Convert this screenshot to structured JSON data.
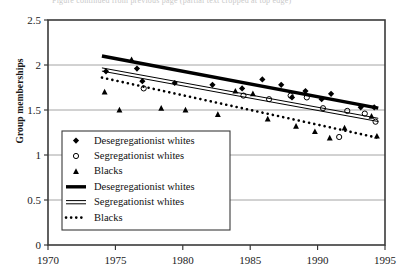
{
  "page": {
    "clipped_header_text": "Figure continued from previous page (partial text cropped at top edge)"
  },
  "chart_data": {
    "type": "scatter",
    "title": "",
    "subtitle": "",
    "xlabel": "",
    "ylabel": "Group memberships",
    "xlim": [
      1970,
      1995
    ],
    "ylim": [
      0,
      2.5
    ],
    "xticks": [
      1970,
      1975,
      1980,
      1985,
      1990,
      1995
    ],
    "yticks": [
      0,
      0.5,
      1,
      1.5,
      2,
      2.5
    ],
    "xtick_labels": [
      "1970",
      "1975",
      "1980",
      "1985",
      "1990",
      "1995"
    ],
    "ytick_labels": [
      "0",
      "0.5",
      "1",
      "1.5",
      "2",
      "2.5"
    ],
    "grid": true,
    "grid_axis": "y",
    "legend_position": "lower-left-inside",
    "series": [
      {
        "name": "Desegregationist whites",
        "kind": "scatter",
        "marker": "filled-diamond",
        "color": "#000000",
        "points": [
          {
            "x": 1974.3,
            "y": 1.93
          },
          {
            "x": 1976.6,
            "y": 1.96
          },
          {
            "x": 1977.0,
            "y": 1.82
          },
          {
            "x": 1979.4,
            "y": 1.8
          },
          {
            "x": 1982.2,
            "y": 1.78
          },
          {
            "x": 1984.4,
            "y": 1.74
          },
          {
            "x": 1985.9,
            "y": 1.84
          },
          {
            "x": 1987.3,
            "y": 1.78
          },
          {
            "x": 1988.1,
            "y": 1.64
          },
          {
            "x": 1989.1,
            "y": 1.71
          },
          {
            "x": 1990.3,
            "y": 1.62
          },
          {
            "x": 1991.0,
            "y": 1.68
          },
          {
            "x": 1993.2,
            "y": 1.53
          },
          {
            "x": 1994.2,
            "y": 1.53
          }
        ]
      },
      {
        "name": "Segregationist whites",
        "kind": "scatter",
        "marker": "open-circle",
        "color": "#000000",
        "points": [
          {
            "x": 1977.1,
            "y": 1.74
          },
          {
            "x": 1984.5,
            "y": 1.66
          },
          {
            "x": 1986.4,
            "y": 1.62
          },
          {
            "x": 1988.0,
            "y": 1.66
          },
          {
            "x": 1989.2,
            "y": 1.64
          },
          {
            "x": 1990.4,
            "y": 1.52
          },
          {
            "x": 1991.6,
            "y": 1.2
          },
          {
            "x": 1992.2,
            "y": 1.49
          },
          {
            "x": 1993.5,
            "y": 1.46
          },
          {
            "x": 1994.3,
            "y": 1.37
          }
        ]
      },
      {
        "name": "Blacks",
        "kind": "scatter",
        "marker": "filled-triangle",
        "color": "#000000",
        "points": [
          {
            "x": 1974.2,
            "y": 1.7
          },
          {
            "x": 1975.3,
            "y": 1.5
          },
          {
            "x": 1976.2,
            "y": 2.06
          },
          {
            "x": 1978.4,
            "y": 1.52
          },
          {
            "x": 1980.2,
            "y": 1.5
          },
          {
            "x": 1982.6,
            "y": 1.45
          },
          {
            "x": 1983.9,
            "y": 1.71
          },
          {
            "x": 1985.2,
            "y": 1.68
          },
          {
            "x": 1986.3,
            "y": 1.4
          },
          {
            "x": 1988.4,
            "y": 1.32
          },
          {
            "x": 1989.8,
            "y": 1.26
          },
          {
            "x": 1990.9,
            "y": 1.19
          },
          {
            "x": 1992.0,
            "y": 1.3
          },
          {
            "x": 1994.0,
            "y": 1.43
          },
          {
            "x": 1994.4,
            "y": 1.21
          }
        ]
      },
      {
        "name": "Desegregationist whites",
        "kind": "trend",
        "style": "thick-solid",
        "color": "#000000",
        "x_start": 1974.0,
        "y_start": 2.1,
        "x_end": 1994.5,
        "y_end": 1.52
      },
      {
        "name": "Segregationist whites",
        "kind": "trend",
        "style": "double-hollow",
        "color": "#000000",
        "x_start": 1974.0,
        "y_start": 1.95,
        "x_end": 1994.5,
        "y_end": 1.39
      },
      {
        "name": "Blacks",
        "kind": "trend",
        "style": "dotted",
        "color": "#000000",
        "x_start": 1974.0,
        "y_start": 1.86,
        "x_end": 1994.5,
        "y_end": 1.19
      }
    ],
    "legend": [
      {
        "label": "Desegregationist whites",
        "swatch": "filled-diamond"
      },
      {
        "label": "Segregationist whites",
        "swatch": "open-circle"
      },
      {
        "label": "Blacks",
        "swatch": "filled-triangle"
      },
      {
        "label": "Desegregationist  whites",
        "swatch": "thick-solid"
      },
      {
        "label": "Segregationist whites",
        "swatch": "double-hollow"
      },
      {
        "label": "Blacks",
        "swatch": "dotted"
      }
    ]
  }
}
